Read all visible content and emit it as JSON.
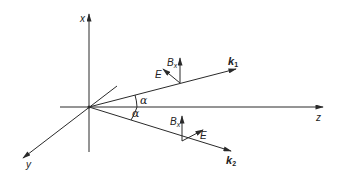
{
  "diagram": {
    "axes": {
      "x": {
        "label": "x"
      },
      "y": {
        "label": "y"
      },
      "z": {
        "label": "z"
      }
    },
    "waves": [
      {
        "vector": "k",
        "subscript": "1",
        "field_E": "E",
        "field_B": "B",
        "field_B_sub": "x"
      },
      {
        "vector": "k",
        "subscript": "2",
        "field_E": "E",
        "field_B": "B",
        "field_B_sub": "x"
      }
    ],
    "angles": [
      {
        "label": "α"
      },
      {
        "label": "α"
      }
    ],
    "colors": {
      "line": "#2a2a2a",
      "background": "#ffffff"
    }
  }
}
